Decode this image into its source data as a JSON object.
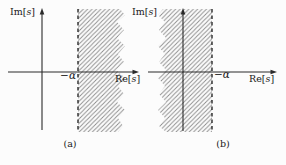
{
  "colors": {
    "background": "#fcfcfc",
    "axis": "#2a2a2a",
    "hatch_line": "#8a8a8a",
    "dashed_boundary": "#2a2a2a",
    "text": "#1a1a1a"
  },
  "figure_a": {
    "caption": "(a)",
    "im_axis": {
      "prefix": "Im[",
      "variable": "s",
      "suffix": "]"
    },
    "re_axis": {
      "prefix": "Re[",
      "variable": "s",
      "suffix": "]"
    },
    "boundary_label": "−α"
  },
  "figure_b": {
    "caption": "(b)",
    "im_axis": {
      "prefix": "Im[",
      "variable": "s",
      "suffix": "]"
    },
    "re_axis": {
      "prefix": "Re[",
      "variable": "s",
      "suffix": "]"
    },
    "boundary_label": "−α"
  }
}
